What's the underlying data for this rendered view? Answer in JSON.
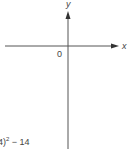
{
  "diagram": {
    "type": "coordinate-axes",
    "axes": {
      "x_label": "x",
      "y_label": "y",
      "origin_label": "0"
    },
    "equation_fragment": {
      "prefix": "4)",
      "exponent": "2",
      "suffix": " − 14"
    },
    "colors": {
      "axis": "#555555",
      "text": "#444444",
      "background": "#ffffff"
    }
  }
}
